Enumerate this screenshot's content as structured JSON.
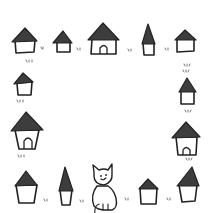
{
  "colors": {
    "background": "#ffffff",
    "roof": "#3d3d3d",
    "outline": "#222222"
  },
  "houses": [
    {
      "id": "top-1",
      "type": "house",
      "door": false
    },
    {
      "id": "top-2",
      "type": "small-house",
      "door": false
    },
    {
      "id": "top-3",
      "type": "house",
      "door": true
    },
    {
      "id": "top-4",
      "type": "spire-house",
      "door": false
    },
    {
      "id": "top-5",
      "type": "house",
      "door": false
    },
    {
      "id": "left-1",
      "type": "small-house",
      "door": false
    },
    {
      "id": "left-2",
      "type": "house",
      "door": true
    },
    {
      "id": "right-1",
      "type": "small-house",
      "door": false
    },
    {
      "id": "right-2",
      "type": "house",
      "door": true
    },
    {
      "id": "bottom-1",
      "type": "house",
      "door": false
    },
    {
      "id": "bottom-2",
      "type": "spire-house",
      "door": false
    },
    {
      "id": "bottom-3",
      "type": "small-house",
      "door": false
    },
    {
      "id": "bottom-4",
      "type": "house",
      "door": false
    }
  ],
  "cat": {
    "pose": "sitting",
    "expression": "smiling"
  },
  "caption": "Cat and houses frame illustration"
}
